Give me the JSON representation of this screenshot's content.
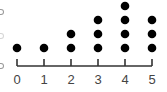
{
  "chart_data": {
    "type": "dot",
    "title": "",
    "xlabel": "",
    "ylabel": "",
    "categories": [
      "0",
      "1",
      "2",
      "3",
      "4",
      "5"
    ],
    "values": [
      1,
      1,
      2,
      3,
      4,
      3
    ],
    "xlim": [
      0,
      5
    ],
    "grid": false,
    "legend": null
  },
  "style": {
    "dot_color": "#000000",
    "axis_color": "#333333",
    "label_color": "#444444"
  }
}
